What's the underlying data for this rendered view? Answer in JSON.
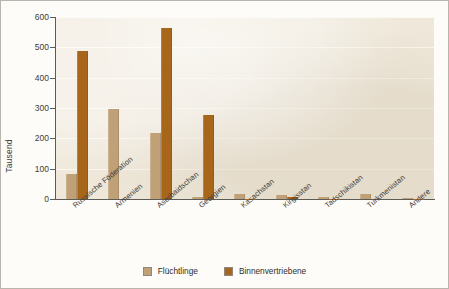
{
  "chart_data": {
    "type": "bar",
    "title": "",
    "subtitle": "",
    "xlabel": "",
    "ylabel": "Tausend",
    "ylim": [
      0,
      600
    ],
    "ytick_step": 100,
    "yticks": [
      "0",
      "100",
      "200",
      "300",
      "400",
      "500",
      "600"
    ],
    "grid": true,
    "grid_axis": "y",
    "legend_position": "bottom-center",
    "categories": [
      "Russische Föderation",
      "Armenien",
      "Aserbaidschan",
      "Georgien",
      "Kasachstan",
      "Kirgisstan",
      "Tadschikistan",
      "Turkmenistan",
      "Andere"
    ],
    "series": [
      {
        "name": "Flüchtlinge",
        "color": "#bfa077",
        "values": [
          83,
          298,
          218,
          5,
          15,
          12,
          6,
          18,
          2
        ]
      },
      {
        "name": "Binnenvertriebene",
        "color": "#a8661a",
        "values": [
          487,
          0,
          563,
          278,
          1,
          7,
          1,
          0,
          1
        ]
      }
    ],
    "annotations": []
  },
  "legend": {
    "items": [
      {
        "label": "Flüchtlinge",
        "color": "#bfa077"
      },
      {
        "label": "Binnenvertriebene",
        "color": "#a8661a"
      }
    ]
  },
  "colors": {
    "plot_background": "#efe8da",
    "figure_background": "#fdfcf8",
    "axis": "#5d5b56",
    "gridline": "#fbf8f1",
    "text": "#3d3b38",
    "series_refugees": "#bfa077",
    "series_idp": "#a8661a"
  }
}
